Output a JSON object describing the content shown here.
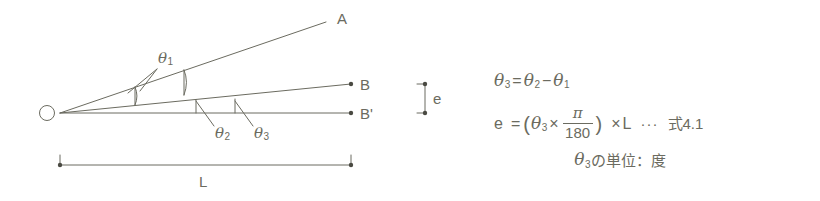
{
  "figure": {
    "type": "geometry-diagram-with-formula",
    "stroke_color": "#6b6b60",
    "background_color": "#ffffff"
  },
  "diagram": {
    "points": {
      "origin": "O",
      "upper": "A",
      "middle": "B",
      "baseline": "B'"
    },
    "angles": {
      "theta1": {
        "symbol": "θ",
        "sub": "1"
      },
      "theta2": {
        "symbol": "θ",
        "sub": "2"
      },
      "theta3": {
        "symbol": "θ",
        "sub": "3"
      }
    },
    "dimension": {
      "length_label": "L",
      "offset_label": "e"
    }
  },
  "equations": {
    "line1": {
      "lhs_sym": "θ",
      "lhs_sub": "3",
      "eq": "=",
      "a_sym": "θ",
      "a_sub": "2",
      "minus": "−",
      "b_sym": "θ",
      "b_sub": "1"
    },
    "line2": {
      "lhs": "e",
      "eq": "=",
      "open_paren": "(",
      "theta_sym": "θ",
      "theta_sub": "3",
      "times1": "×",
      "numerator": "π",
      "denominator": "180",
      "close_paren": ")",
      "times2": "×",
      "length": "L",
      "dots": "···",
      "ref": "式4.1"
    },
    "line3": {
      "theta_sym": "θ",
      "theta_sub": "3",
      "text": "の単位：度"
    }
  }
}
